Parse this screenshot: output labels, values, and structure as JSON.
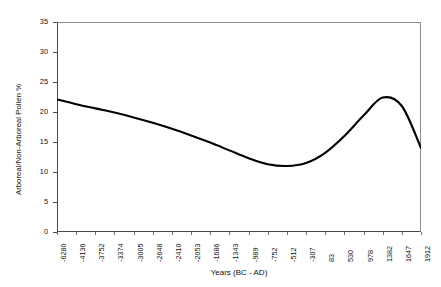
{
  "chart_data": {
    "type": "line",
    "title": "",
    "xlabel": "Years (BC - AD)",
    "ylabel": "Arboreal/Non-Arboreal Pollen %",
    "ylim": [
      0,
      35
    ],
    "yticks": [
      0,
      5,
      10,
      15,
      20,
      25,
      30,
      35
    ],
    "grid": false,
    "legend": null,
    "categories": [
      "-6280",
      "-4136",
      "-3752",
      "-3374",
      "-3005",
      "-2648",
      "-2410",
      "-2053",
      "-1686",
      "-1343",
      "-989",
      "-752",
      "-512",
      "-307",
      "83",
      "530",
      "978",
      "1382",
      "1647",
      "1912"
    ],
    "series": [
      {
        "name": "Arboreal/Non-Arboreal Pollen %",
        "color": "#000000",
        "values": [
          22.1,
          21.3,
          20.6,
          19.9,
          19.1,
          18.2,
          17.2,
          16.1,
          14.9,
          13.6,
          12.3,
          11.3,
          11.0,
          11.5,
          13.2,
          16.0,
          19.4,
          22.4,
          21.0,
          14.0
        ]
      }
    ]
  },
  "axes": {
    "y_tick_labels": [
      "35",
      "30",
      "25",
      "20",
      "15",
      "10",
      "5",
      "0"
    ],
    "y_title": "Arboreal/Non-Arboreal Pollen %",
    "x_title": "Years (BC - AD)",
    "x_tick_labels": [
      "-6280",
      "-4136",
      "-3752",
      "-3374",
      "-3005",
      "-2648",
      "-2410",
      "-2053",
      "-1686",
      "-1343",
      "-989",
      "-752",
      "-512",
      "-307",
      "83",
      "530",
      "978",
      "1382",
      "1647",
      "1912"
    ]
  },
  "colors": {
    "curve": "#000000",
    "frame": "#4a4a4a",
    "frame_light": "#8d8d8d",
    "text": "#111111",
    "background": "#ffffff"
  }
}
